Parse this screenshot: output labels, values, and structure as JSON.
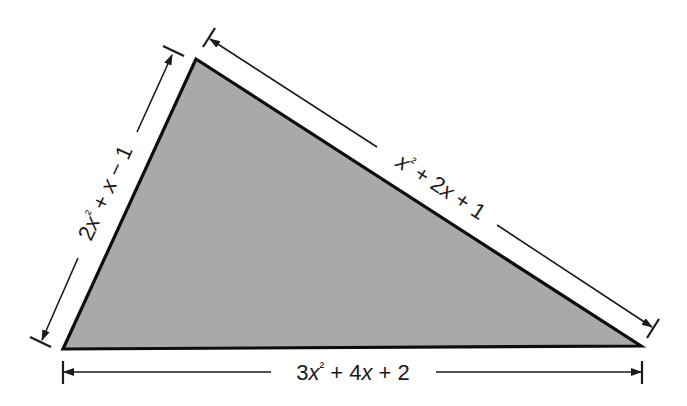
{
  "figure": {
    "type": "triangle-with-dimensioned-sides",
    "fill_color": "#a9a9a9",
    "edge_color": "#0d0d0d",
    "vertices": {
      "top": [
        196,
        59
      ],
      "bottom_left": [
        63,
        349
      ],
      "bottom_right": [
        641,
        346
      ]
    },
    "sides": {
      "left": {
        "label": "2x² + x − 1",
        "parts": [
          "2",
          "x",
          "²",
          " + ",
          "x",
          " − 1"
        ]
      },
      "hypotenuse": {
        "label": "x² + 2x + 1",
        "parts": [
          "x",
          "²",
          " + 2",
          "x",
          " + 1"
        ]
      },
      "bottom": {
        "label": "3x² + 4x + 2",
        "parts": [
          "3",
          "x",
          "²",
          " + 4",
          "x",
          " + 2"
        ]
      }
    }
  }
}
